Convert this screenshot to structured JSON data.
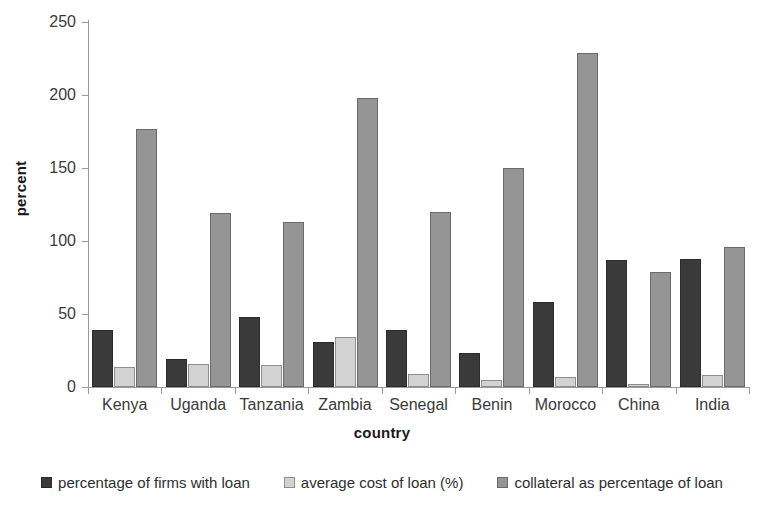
{
  "chart_data": {
    "type": "bar",
    "title": "",
    "xlabel": "country",
    "ylabel": "percent",
    "ylim": [
      0,
      250
    ],
    "yticks": [
      0,
      50,
      100,
      150,
      200,
      250
    ],
    "grid": false,
    "legend_position": "bottom",
    "categories": [
      "Kenya",
      "Uganda",
      "Tanzania",
      "Zambia",
      "Senegal",
      "Benin",
      "Morocco",
      "China",
      "India"
    ],
    "series": [
      {
        "name": "percentage of firms with loan",
        "color": "#3a3a3a",
        "values": [
          39,
          19,
          48,
          31,
          39,
          23,
          58,
          87,
          88
        ]
      },
      {
        "name": "average cost of loan (%)",
        "color": "#d2d2d2",
        "values": [
          14,
          16,
          15,
          34,
          9,
          5,
          7,
          2,
          8
        ]
      },
      {
        "name": "collateral as percentage of loan",
        "color": "#959595",
        "values": [
          177,
          119,
          113,
          198,
          120,
          150,
          229,
          79,
          96
        ]
      }
    ]
  },
  "axis": {
    "y_title": "percent",
    "x_title": "country"
  }
}
